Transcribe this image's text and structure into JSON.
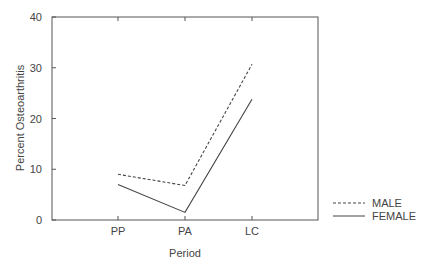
{
  "chart_data": {
    "type": "line",
    "title": "",
    "xlabel": "Period",
    "ylabel": "Percent Osteoarthritis",
    "categories": [
      "PP",
      "PA",
      "LC"
    ],
    "ylim": [
      0,
      40
    ],
    "yticks": [
      0,
      10,
      20,
      30,
      40
    ],
    "grid": false,
    "legend_position": "right-bottom",
    "series": [
      {
        "name": "MALE",
        "style": "dashed",
        "color": "#444444",
        "values": [
          9.0,
          6.8,
          30.7
        ]
      },
      {
        "name": "FEMALE",
        "style": "solid",
        "color": "#444444",
        "values": [
          7.0,
          1.5,
          23.8
        ]
      }
    ]
  },
  "colors": {
    "axis": "#555555",
    "text": "#444444",
    "line": "#444444"
  }
}
